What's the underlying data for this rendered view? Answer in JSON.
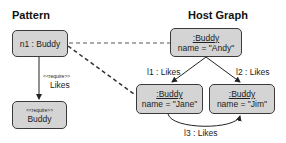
{
  "pattern": {
    "title": "Pattern",
    "node_n1": {
      "label": "n1 : Buddy"
    },
    "node_required": {
      "stereotype": "<<require>>",
      "label": "Buddy"
    },
    "edge": {
      "stereotype": "<<require>>",
      "label": "Likes"
    }
  },
  "host_graph": {
    "title": "Host Graph",
    "nodes": [
      {
        "type": ":Buddy",
        "attr": "name = \"Andy\""
      },
      {
        "type": ":Buddy",
        "attr": "name = \"Jane\""
      },
      {
        "type": ":Buddy",
        "attr": "name = \"Jim\""
      }
    ],
    "edges": [
      {
        "label": "l1 : Likes"
      },
      {
        "label": "l2 : Likes"
      },
      {
        "label": "l3 : Likes"
      }
    ]
  },
  "colors": {
    "node_fill": "#d4d4d4",
    "node_border": "#3a3a3a",
    "mapping_line": "#555555"
  }
}
